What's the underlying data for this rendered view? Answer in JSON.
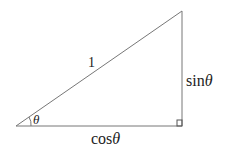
{
  "diagram": {
    "type": "right-triangle",
    "stroke_color": "#777777",
    "labels": {
      "hypotenuse": "1",
      "opposite_fn": "sin",
      "opposite_var": "θ",
      "adjacent_fn": "cos",
      "adjacent_var": "θ",
      "angle": "θ"
    }
  }
}
